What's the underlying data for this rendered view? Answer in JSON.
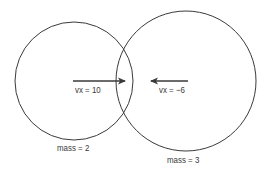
{
  "diagram": {
    "colors": {
      "stroke": "#3a3a3a",
      "background": "#ffffff",
      "text": "#3a3a3a"
    },
    "balls": [
      {
        "name": "ball-left",
        "cx": 74,
        "cy": 81,
        "r": 59,
        "velocity_label": "vx = 10",
        "mass_label": "mass = 2",
        "arrow": {
          "x1": 73,
          "y1": 81,
          "x2": 125,
          "y2": 81,
          "direction": "right"
        }
      },
      {
        "name": "ball-right",
        "cx": 186,
        "cy": 81,
        "r": 70,
        "velocity_label": "vx = −6",
        "mass_label": "mass = 3",
        "arrow": {
          "x1": 188,
          "y1": 81,
          "x2": 151,
          "y2": 81,
          "direction": "left"
        }
      }
    ]
  }
}
